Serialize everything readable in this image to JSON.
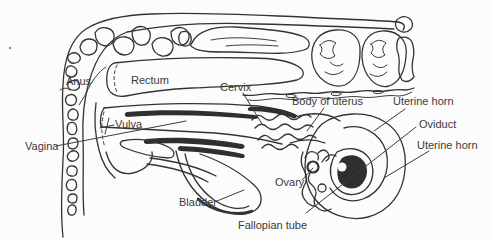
{
  "diagram": {
    "background": "#fcfcfc",
    "ink_color": "#333333",
    "label_color": "#3a3a3a",
    "labels": {
      "anus": "Anus",
      "rectum": "Rectum",
      "cervix": "Cervix",
      "body_of_uterus": "Body of uterus",
      "uterine_horn_upper": "Uterine horn",
      "oviduct": "Oviduct",
      "uterine_horn_lower": "Uterine horn",
      "vulva": "Vulva",
      "vagina": "Vagina",
      "ovary": "Ovary",
      "bladder": "Bladder",
      "fallopian_tube": "Fallopian tube"
    }
  }
}
